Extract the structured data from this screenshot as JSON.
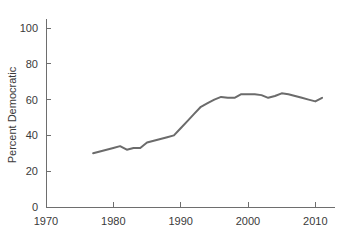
{
  "chart_data": {
    "type": "line",
    "title": "",
    "xlabel": "",
    "ylabel": "Percent Democratic",
    "xlim": [
      1970,
      2013
    ],
    "ylim": [
      0,
      105
    ],
    "xticks": [
      1970,
      1980,
      1990,
      2000,
      2010
    ],
    "xtick_labels": [
      "1970",
      "1980",
      "1990",
      "2000",
      "2010"
    ],
    "yticks": [
      0,
      20,
      40,
      60,
      80,
      100
    ],
    "ytick_labels": [
      "0",
      "20",
      "40",
      "60",
      "80",
      "100"
    ],
    "grid": false,
    "legend": "none",
    "line_color": "#6b6b6b",
    "axis_color": "#6e6e6e",
    "text_color": "#3a3a3a",
    "series": [
      {
        "name": "Percent Democratic",
        "x": [
          1977,
          1978,
          1979,
          1980,
          1981,
          1982,
          1983,
          1984,
          1985,
          1986,
          1987,
          1988,
          1989,
          1990,
          1991,
          1992,
          1993,
          1994,
          1995,
          1996,
          1997,
          1998,
          1999,
          2000,
          2001,
          2002,
          2003,
          2004,
          2005,
          2006,
          2007,
          2008,
          2009,
          2010,
          2011
        ],
        "values": [
          30.0,
          31.0,
          32.0,
          33.0,
          34.0,
          32.0,
          33.0,
          33.0,
          36.0,
          37.0,
          38.0,
          39.0,
          40.0,
          44.0,
          48.0,
          52.0,
          56.0,
          58.0,
          60.0,
          61.5,
          61.0,
          61.0,
          63.0,
          63.0,
          63.0,
          62.5,
          61.0,
          62.0,
          63.5,
          63.0,
          62.0,
          61.0,
          60.0,
          59.0,
          61.0
        ]
      }
    ]
  }
}
